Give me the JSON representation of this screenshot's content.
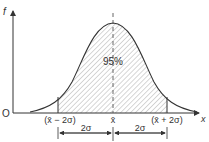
{
  "diagram": {
    "type": "normal-distribution",
    "axis_y_label": "f",
    "axis_x_label": "x",
    "origin_label": "O",
    "center_label": "95%",
    "mean_label": "x̄",
    "left_bound_label": "(x̄ − 2σ)",
    "right_bound_label": "(x̄ + 2σ)",
    "left_span_label": "2σ",
    "right_span_label": "2σ",
    "shaded_area_percent": 95,
    "line_color": "#333333",
    "hatch_color": "#9a9a9a"
  }
}
